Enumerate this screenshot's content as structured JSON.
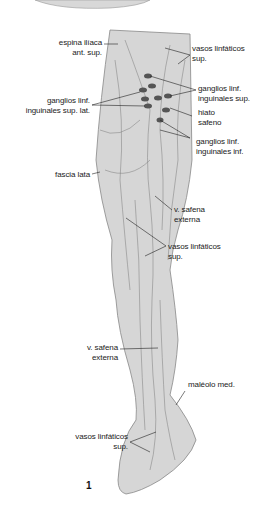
{
  "figure": {
    "number": "1",
    "labels": {
      "espina_iliaca": [
        "espina ilíaca",
        "ant. sup."
      ],
      "vasos_linfaticos_top": [
        "vasos linfáticos",
        "sup."
      ],
      "ganglios_ing_sup": [
        "ganglios linf.",
        "inguinales sup."
      ],
      "ganglios_ing_sup_lat": [
        "ganglios linf.",
        "inguinales sup. lat."
      ],
      "hiato_safeno": [
        "hiato",
        "safeno"
      ],
      "ganglios_ing_inf": [
        "ganglios linf.",
        "inguinales inf."
      ],
      "fascia_lata": "fascia lata",
      "v_safena_externa_thigh": [
        "v. safena",
        "externa"
      ],
      "vasos_linfaticos_knee": [
        "vasos linfáticos",
        "sup."
      ],
      "v_safena_externa_leg": [
        "v. safena",
        "externa"
      ],
      "maleolo_med": "maléolo med.",
      "vasos_linfaticos_foot": [
        "vasos linfáticos",
        "sup."
      ]
    }
  }
}
